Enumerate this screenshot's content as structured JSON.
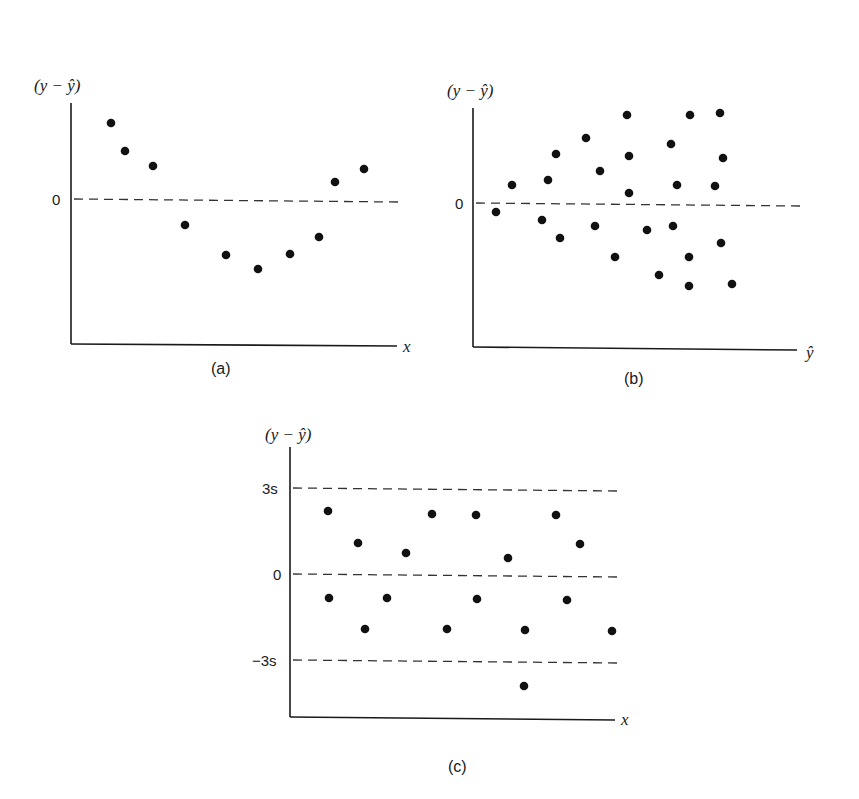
{
  "figure": {
    "panels": [
      {
        "id": "a",
        "caption": "(a)",
        "ylabel": "(y − ŷ)",
        "xlabel": "x",
        "tick_zero": "0"
      },
      {
        "id": "b",
        "caption": "(b)",
        "ylabel": "(y − ŷ)",
        "xlabel": "ŷ",
        "tick_zero": "0"
      },
      {
        "id": "c",
        "caption": "(c)",
        "ylabel": "(y − ŷ)",
        "xlabel": "x",
        "tick_top": "3s",
        "tick_zero": "0",
        "tick_bottom": "−3s"
      }
    ]
  },
  "chart_data": [
    {
      "type": "scatter",
      "title": "(a)",
      "xlabel": "x",
      "ylabel": "(y − ŷ)",
      "reference_lines": [
        {
          "y": 0,
          "style": "dashed",
          "label": "0"
        }
      ],
      "grid": false,
      "note": "Residuals vs x showing curved (U-shaped) pattern; values in relative units (zero line = 0)",
      "points": [
        {
          "x": 1.0,
          "y": 2.6
        },
        {
          "x": 1.4,
          "y": 1.6
        },
        {
          "x": 2.2,
          "y": 1.1
        },
        {
          "x": 3.2,
          "y": -0.9
        },
        {
          "x": 4.4,
          "y": -1.9
        },
        {
          "x": 5.3,
          "y": -2.4
        },
        {
          "x": 6.2,
          "y": -1.9
        },
        {
          "x": 7.0,
          "y": -1.3
        },
        {
          "x": 7.5,
          "y": 0.6
        },
        {
          "x": 8.3,
          "y": 1.0
        }
      ],
      "pixel_points": [
        [
          111,
          123
        ],
        [
          125,
          151
        ],
        [
          153,
          166
        ],
        [
          185,
          225
        ],
        [
          226,
          255
        ],
        [
          258,
          269
        ],
        [
          290,
          254
        ],
        [
          319,
          237
        ],
        [
          335,
          182
        ],
        [
          364,
          169
        ]
      ]
    },
    {
      "type": "scatter",
      "title": "(b)",
      "xlabel": "ŷ",
      "ylabel": "(y − ŷ)",
      "reference_lines": [
        {
          "y": 0,
          "style": "dashed",
          "label": "0"
        }
      ],
      "grid": false,
      "note": "Residuals vs fitted values fanning out (increasing variance)",
      "pixel_points": [
        [
          496,
          212
        ],
        [
          512,
          185
        ],
        [
          542,
          220
        ],
        [
          548,
          180
        ],
        [
          556,
          154
        ],
        [
          560,
          238
        ],
        [
          586,
          138
        ],
        [
          595,
          226
        ],
        [
          600,
          171
        ],
        [
          615,
          257
        ],
        [
          627,
          115
        ],
        [
          629,
          156
        ],
        [
          629,
          193
        ],
        [
          647,
          230
        ],
        [
          659,
          275
        ],
        [
          671,
          144
        ],
        [
          673,
          226
        ],
        [
          677,
          185
        ],
        [
          689,
          257
        ],
        [
          690,
          115
        ],
        [
          689,
          286
        ],
        [
          715,
          186
        ],
        [
          720,
          113
        ],
        [
          721,
          243
        ],
        [
          723,
          158
        ],
        [
          732,
          284
        ]
      ]
    },
    {
      "type": "scatter",
      "title": "(c)",
      "xlabel": "x",
      "ylabel": "(y − ŷ)",
      "reference_lines": [
        {
          "y": 3,
          "style": "dashed",
          "label": "3s"
        },
        {
          "y": 0,
          "style": "dashed",
          "label": "0"
        },
        {
          "y": -3,
          "style": "dashed",
          "label": "−3s"
        }
      ],
      "ylim_units": "s",
      "grid": false,
      "note": "Residuals in units of s; one outlier below −3s",
      "points": [
        {
          "x": 1,
          "y": 2.2
        },
        {
          "x": 1,
          "y": -0.8
        },
        {
          "x": 2,
          "y": 1.1
        },
        {
          "x": 2.2,
          "y": -1.9
        },
        {
          "x": 3,
          "y": -0.8
        },
        {
          "x": 3.5,
          "y": 0.7
        },
        {
          "x": 4.2,
          "y": 2.1
        },
        {
          "x": 4.6,
          "y": -1.9
        },
        {
          "x": 5.3,
          "y": 2.1
        },
        {
          "x": 5.3,
          "y": -0.9
        },
        {
          "x": 6.2,
          "y": 0.5
        },
        {
          "x": 6.6,
          "y": -1.9
        },
        {
          "x": 6.6,
          "y": -3.9
        },
        {
          "x": 7.4,
          "y": 2.1
        },
        {
          "x": 7.7,
          "y": -0.9
        },
        {
          "x": 8.1,
          "y": 1.0
        },
        {
          "x": 9.0,
          "y": -1.9
        }
      ],
      "pixel_points": [
        [
          328,
          511
        ],
        [
          329,
          598
        ],
        [
          358,
          543
        ],
        [
          365,
          629
        ],
        [
          387,
          598
        ],
        [
          406,
          553
        ],
        [
          432,
          514
        ],
        [
          447,
          629
        ],
        [
          476,
          515
        ],
        [
          477,
          599
        ],
        [
          508,
          558
        ],
        [
          525,
          630
        ],
        [
          524,
          686
        ],
        [
          556,
          515
        ],
        [
          567,
          600
        ],
        [
          580,
          544
        ],
        [
          612,
          631
        ]
      ]
    }
  ]
}
